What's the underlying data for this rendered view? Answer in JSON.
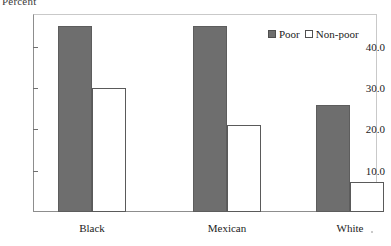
{
  "chart_data": {
    "type": "bar",
    "title": "Percent",
    "xlabel": "",
    "ylabel": "Percent",
    "categories": [
      "Black",
      "Mexican",
      "White"
    ],
    "series": [
      {
        "name": "Poor",
        "values": [
          45.0,
          45.0,
          26.0
        ]
      },
      {
        "name": "Non-poor",
        "values": [
          30.0,
          21.0,
          7.3
        ]
      }
    ],
    "ylim": [
      0,
      48
    ],
    "yticks": [
      10.0,
      20.0,
      30.0,
      40.0
    ],
    "ytick_labels": [
      "10.0",
      "20.0",
      "30.0",
      "40.0"
    ],
    "grid": false,
    "legend_position": "top-right",
    "colors": {
      "poor": "#6e6e6e",
      "non_poor": "#ffffff",
      "bar_outline": "#5a5a5a",
      "axis": "#8d8d8d",
      "text": "#1b1b1b",
      "background": "#ffffff"
    }
  },
  "legend": {
    "entries": [
      {
        "label": "Poor",
        "swatch": "filled-square-icon"
      },
      {
        "label": "Non-poor",
        "swatch": "hollow-square-icon"
      }
    ]
  }
}
